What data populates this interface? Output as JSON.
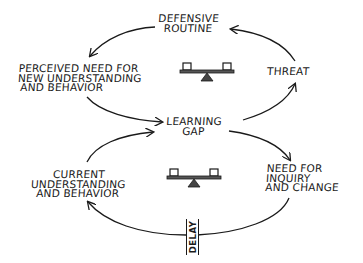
{
  "diagram": {
    "type": "causal-loop",
    "loops": [
      {
        "name": "defensive-loop",
        "nodes": [
          "learning_gap",
          "threat",
          "defensive_routine",
          "perceived_need"
        ],
        "balance_icon": "seesaw-icon"
      },
      {
        "name": "learning-loop",
        "nodes": [
          "learning_gap",
          "need_for_inquiry",
          "current_understanding"
        ],
        "balance_icon": "seesaw-icon",
        "delay_label": "DELAY"
      }
    ],
    "nodes": {
      "defensive_routine": {
        "lines": [
          "DEFENSIVE",
          "ROUTINE"
        ]
      },
      "perceived_need": {
        "lines": [
          "PERCEIVED NEED FOR",
          "NEW UNDERSTANDING",
          "AND BEHAVIOR"
        ]
      },
      "threat": {
        "lines": [
          "THREAT"
        ]
      },
      "learning_gap": {
        "lines": [
          "LEARNING",
          "GAP"
        ]
      },
      "current_understanding": {
        "lines": [
          "CURRENT",
          "UNDERSTANDING",
          "AND BEHAVIOR"
        ]
      },
      "need_for_inquiry": {
        "lines": [
          "NEED FOR",
          "INQUIRY",
          "AND CHANGE"
        ]
      }
    },
    "delay": {
      "label": "DELAY"
    },
    "colors": {
      "ink": "#1a1a1a",
      "background": "#ffffff"
    }
  }
}
